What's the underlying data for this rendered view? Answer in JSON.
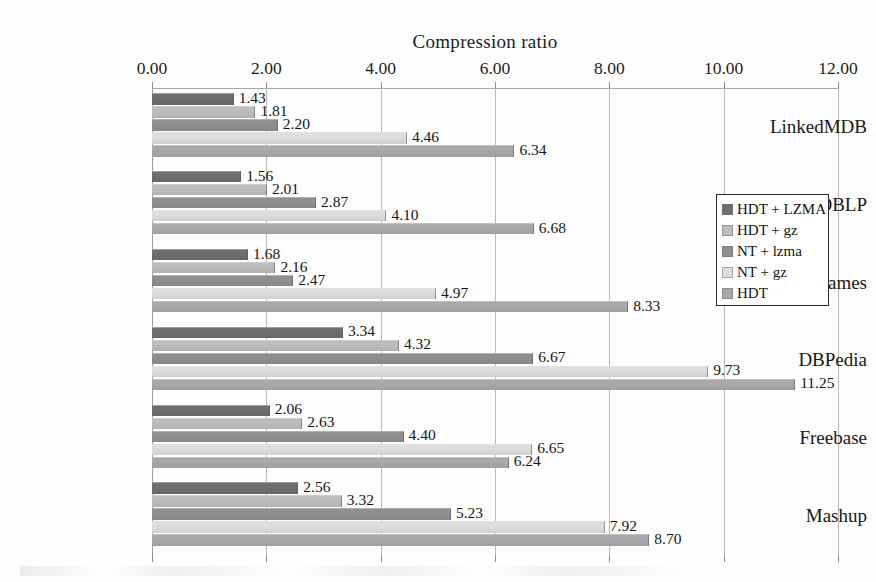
{
  "chart_data": {
    "type": "bar",
    "orientation": "horizontal",
    "title": "Compression ratio",
    "xlabel": "",
    "ylabel": "",
    "xlim": [
      0.0,
      12.0
    ],
    "xticks": [
      "0.00",
      "2.00",
      "4.00",
      "6.00",
      "8.00",
      "10.00",
      "12.00"
    ],
    "xtick_values": [
      0,
      2,
      4,
      6,
      8,
      10,
      12
    ],
    "grid": "vertical",
    "legend_position": "center-right",
    "categories": [
      "LinkedMDB",
      "DBLP",
      "Geonames",
      "DBPedia",
      "Freebase",
      "Mashup"
    ],
    "series": [
      {
        "name": "HDT + LZMA",
        "color": "#6e6e6e",
        "values": [
          1.43,
          1.56,
          1.68,
          3.34,
          2.06,
          2.56
        ],
        "labels": [
          "1.43",
          "1.56",
          "1.68",
          "3.34",
          "2.06",
          "2.56"
        ]
      },
      {
        "name": "HDT + gz",
        "color": "#bdbdbd",
        "values": [
          1.81,
          2.01,
          2.16,
          4.32,
          2.63,
          3.32
        ],
        "labels": [
          "1.81",
          "2.01",
          "2.16",
          "4.32",
          "2.63",
          "3.32"
        ]
      },
      {
        "name": "NT + lzma",
        "color": "#8f8f8f",
        "values": [
          2.2,
          2.87,
          2.47,
          6.67,
          4.4,
          5.23
        ],
        "labels": [
          "2.20",
          "2.87",
          "2.47",
          "6.67",
          "4.40",
          "5.23"
        ]
      },
      {
        "name": "NT + gz",
        "color": "#dedede",
        "values": [
          4.46,
          4.1,
          4.97,
          9.73,
          6.65,
          7.92
        ],
        "labels": [
          "4.46",
          "4.10",
          "4.97",
          "9.73",
          "6.65",
          "7.92"
        ]
      },
      {
        "name": "HDT",
        "color": "#a9a9a9",
        "values": [
          6.34,
          6.68,
          8.33,
          11.25,
          6.24,
          8.7
        ],
        "labels": [
          "6.34",
          "6.68",
          "8.33",
          "11.25",
          "6.24",
          "8.70"
        ]
      }
    ]
  },
  "legend": {
    "items": [
      {
        "label": "HDT + LZMA",
        "color": "#6e6e6e"
      },
      {
        "label": "HDT + gz",
        "color": "#bdbdbd"
      },
      {
        "label": "NT + lzma",
        "color": "#8f8f8f"
      },
      {
        "label": "NT + gz",
        "color": "#dedede"
      },
      {
        "label": "HDT",
        "color": "#a9a9a9"
      }
    ]
  }
}
